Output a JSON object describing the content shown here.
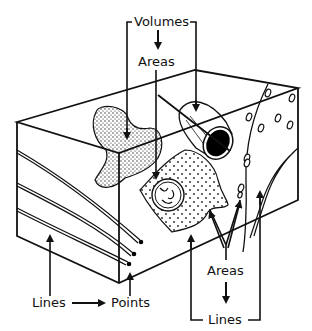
{
  "diagram": {
    "labels": {
      "volumes_top": "Volumes",
      "areas_top": "Areas",
      "lines_left": "Lines",
      "points": "Points",
      "areas_bottom": "Areas",
      "lines_bottom": "Lines"
    },
    "relations": [
      {
        "from": "Volumes",
        "to": "Areas",
        "arrow": "down"
      },
      {
        "from": "Lines",
        "to": "Points",
        "arrow": "right"
      },
      {
        "from": "Areas",
        "to": "Lines",
        "arrow": "down"
      }
    ],
    "colors": {
      "ink": "#111111",
      "background": "#ffffff"
    }
  }
}
